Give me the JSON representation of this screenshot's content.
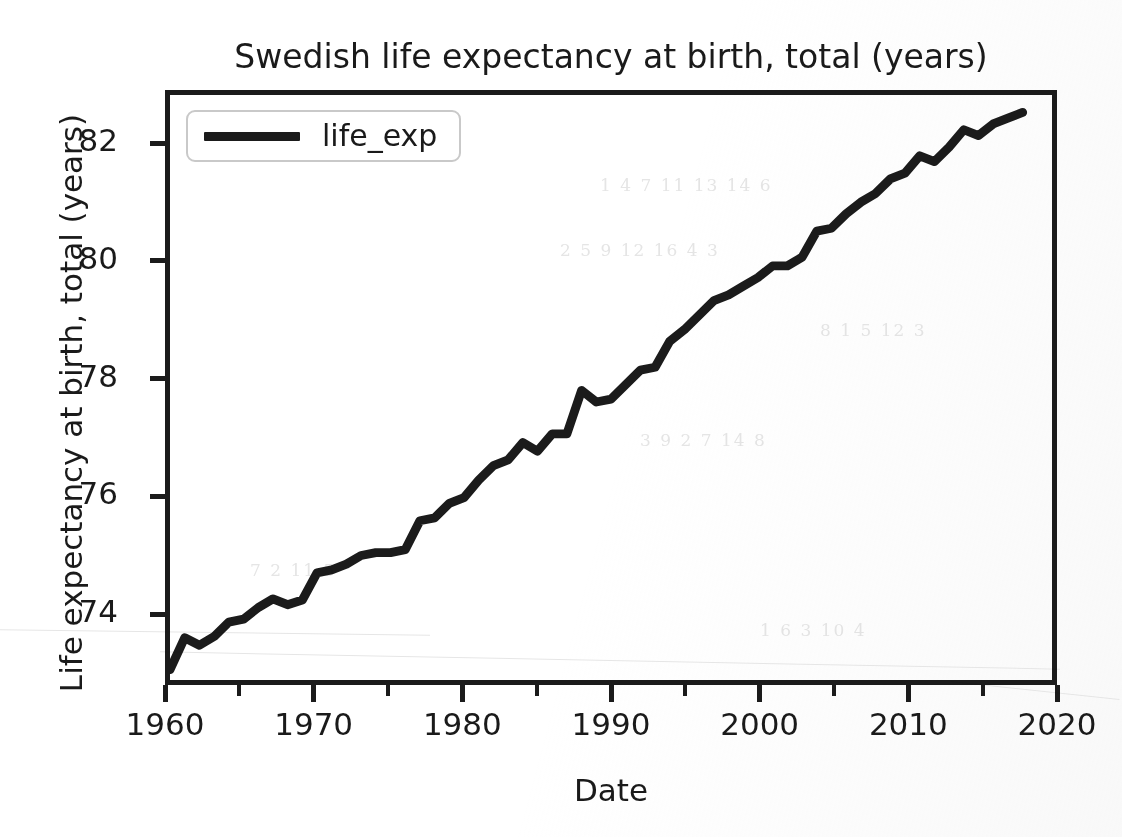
{
  "chart_data": {
    "type": "line",
    "title": "Swedish life expectancy at birth, total (years)",
    "xlabel": "Date",
    "ylabel": "Life expectancy at birth, total (years)",
    "grid": false,
    "legend_position": "upper left",
    "xlim": [
      1960,
      2020
    ],
    "ylim": [
      72.8,
      82.9
    ],
    "xticks": [
      1960,
      1970,
      1980,
      1990,
      2000,
      2010,
      2020
    ],
    "xtick_labels": [
      "1960",
      "1970",
      "1980",
      "1990",
      "2000",
      "2010",
      "2020"
    ],
    "xminor_ticks": [
      1965,
      1975,
      1985,
      1995,
      2005,
      2015
    ],
    "yticks": [
      74,
      76,
      78,
      80,
      82
    ],
    "ytick_labels": [
      "74",
      "76",
      "78",
      "80",
      "82"
    ],
    "line_color": "#1b1b1b",
    "line_width": 9,
    "series": [
      {
        "name": "life_exp",
        "x": [
          1960,
          1961,
          1962,
          1963,
          1964,
          1965,
          1966,
          1967,
          1968,
          1969,
          1970,
          1971,
          1972,
          1973,
          1974,
          1975,
          1976,
          1977,
          1978,
          1979,
          1980,
          1981,
          1982,
          1983,
          1984,
          1985,
          1986,
          1987,
          1988,
          1989,
          1990,
          1991,
          1992,
          1993,
          1994,
          1995,
          1996,
          1997,
          1998,
          1999,
          2000,
          2001,
          2002,
          2003,
          2004,
          2005,
          2006,
          2007,
          2008,
          2009,
          2010,
          2011,
          2012,
          2013,
          2014,
          2015,
          2016,
          2017,
          2018
        ],
        "values": [
          72.98,
          73.53,
          73.4,
          73.55,
          73.8,
          73.85,
          74.05,
          74.2,
          74.1,
          74.18,
          74.65,
          74.7,
          74.8,
          74.95,
          75.0,
          75.0,
          75.05,
          75.55,
          75.6,
          75.85,
          75.95,
          76.25,
          76.5,
          76.6,
          76.9,
          76.75,
          77.05,
          77.05,
          77.8,
          77.6,
          77.65,
          77.9,
          78.15,
          78.2,
          78.65,
          78.85,
          79.1,
          79.35,
          79.45,
          79.6,
          79.75,
          79.95,
          79.95,
          80.1,
          80.55,
          80.6,
          80.85,
          81.05,
          81.2,
          81.45,
          81.55,
          81.85,
          81.75,
          82.0,
          82.3,
          82.2,
          82.4,
          82.5,
          82.6
        ]
      }
    ]
  },
  "legend": {
    "entries": [
      {
        "label": "life_exp",
        "color": "#1b1b1b"
      }
    ]
  },
  "artifacts": {
    "ghost_text": [
      "1 4 7 11 13 14 6",
      "2 5 9 12 16 4 3",
      "8 1 5 12 3",
      "3 9 2 7 14 8",
      "7 2 11 5",
      "1 6 3 10 4"
    ]
  }
}
